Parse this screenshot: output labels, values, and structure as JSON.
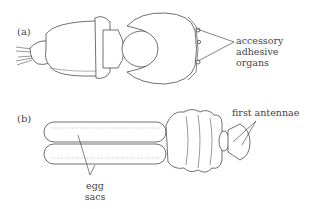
{
  "figure": {
    "panels": [
      {
        "label": "(a)",
        "annotations": [
          {
            "text_lines": [
              "accessory",
              "adhesive",
              "organs"
            ]
          }
        ],
        "marker": "8"
      },
      {
        "label": "(b)",
        "annotations": [
          {
            "text_lines": [
              "first antennae"
            ]
          },
          {
            "text_lines": [
              "egg",
              "sacs"
            ]
          }
        ]
      }
    ]
  }
}
